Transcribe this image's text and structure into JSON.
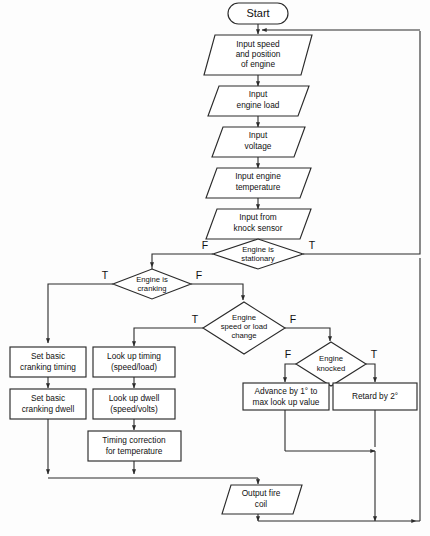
{
  "diagram": {
    "stroke_color": "#2b2b2b",
    "fill_color": "#ffffff",
    "nodes": {
      "start": {
        "label": "Start",
        "shape": "terminator"
      },
      "input_speed": {
        "line1": "Input speed",
        "line2": "and position",
        "line3": "of engine",
        "shape": "parallelogram"
      },
      "input_load": {
        "line1": "Input",
        "line2": "engine load",
        "shape": "parallelogram"
      },
      "input_voltage": {
        "line1": "Input",
        "line2": "voltage",
        "shape": "parallelogram"
      },
      "input_temp": {
        "line1": "Input engine",
        "line2": "temperature",
        "shape": "parallelogram"
      },
      "input_knock": {
        "line1": "Input from",
        "line2": "knock sensor",
        "shape": "parallelogram"
      },
      "engine_stationary": {
        "line1": "Engine is",
        "line2": "stationary",
        "shape": "decision",
        "false_label": "F",
        "true_label": "T"
      },
      "engine_cranking": {
        "line1": "Engine is",
        "line2": "cranking",
        "shape": "decision",
        "true_label": "T",
        "false_label": "F"
      },
      "speed_load_change": {
        "line1": "Engine",
        "line2": "speed or load",
        "line3": "change",
        "shape": "decision",
        "true_label": "T",
        "false_label": "F"
      },
      "engine_knocked": {
        "line1": "Engine",
        "line2": "knocked",
        "shape": "decision",
        "false_label": "F",
        "true_label": "T"
      },
      "set_cranking_timing": {
        "line1": "Set basic",
        "line2": "cranking timing",
        "shape": "process"
      },
      "set_cranking_dwell": {
        "line1": "Set basic",
        "line2": "cranking dwell",
        "shape": "process"
      },
      "lookup_timing": {
        "line1": "Look up timing",
        "line2": "(speed/load)",
        "shape": "process"
      },
      "lookup_dwell": {
        "line1": "Look up dwell",
        "line2": "(speed/volts)",
        "shape": "process"
      },
      "timing_correction": {
        "line1": "Timing correction",
        "line2": "for temperature",
        "shape": "process"
      },
      "advance": {
        "line1": "Advance by  1° to",
        "line2": "max look up value",
        "shape": "process"
      },
      "retard": {
        "line1": "Retard by 2°",
        "shape": "process"
      },
      "output_fire_coil": {
        "line1": "Output fire",
        "line2": "coil",
        "shape": "parallelogram"
      }
    }
  }
}
